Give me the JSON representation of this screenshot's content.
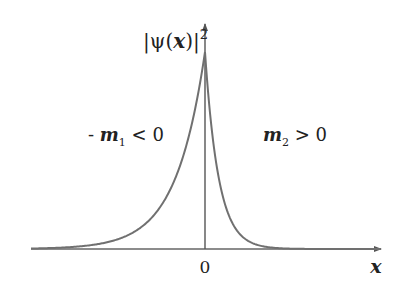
{
  "figure": {
    "y_axis_label": {
      "bar_left": "|",
      "psi": "ψ",
      "open": "(",
      "var": "x",
      "close": ")",
      "bar_right": "|",
      "exponent": "2"
    },
    "x_axis_label": "x",
    "origin_label": "0",
    "left_region": {
      "prefix": "- ",
      "symbol": "m",
      "subscript": "1",
      "relation": " < 0"
    },
    "right_region": {
      "symbol": "m",
      "subscript": "2",
      "relation": " > 0"
    },
    "colors": {
      "axis": "#555555",
      "curve": "#707070",
      "text": "#222222"
    }
  },
  "chart_data": {
    "type": "line",
    "title": "",
    "xlabel": "x",
    "ylabel": "|ψ(x)|²",
    "x_ticks": [
      "0"
    ],
    "annotations": [
      "- m1 < 0",
      "m2 > 0"
    ],
    "grid": false,
    "series": [
      {
        "name": "|ψ(x)|²",
        "peak_x": 0,
        "left_decay_length_px": 29,
        "right_decay_length_px": 13.5
      }
    ]
  }
}
